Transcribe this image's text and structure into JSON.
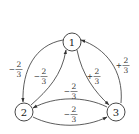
{
  "diagram": {
    "type": "state-transition-graph",
    "nodes": [
      {
        "id": "1",
        "label": "1"
      },
      {
        "id": "2",
        "label": "2"
      },
      {
        "id": "3",
        "label": "3"
      }
    ],
    "edges": [
      {
        "from": "1",
        "to": "2",
        "sign": "−",
        "num": "2",
        "den": "3"
      },
      {
        "from": "2",
        "to": "1",
        "sign": "−",
        "num": "2",
        "den": "3"
      },
      {
        "from": "1",
        "to": "3",
        "sign": "+",
        "num": "2",
        "den": "3"
      },
      {
        "from": "3",
        "to": "1",
        "sign": "+",
        "num": "2",
        "den": "3"
      },
      {
        "from": "3",
        "to": "2",
        "sign": "−",
        "num": "2",
        "den": "3"
      },
      {
        "from": "2",
        "to": "3",
        "sign": "−",
        "num": "2",
        "den": "3"
      }
    ],
    "colors": {
      "stroke": "#333333",
      "background": "#ffffff"
    }
  }
}
